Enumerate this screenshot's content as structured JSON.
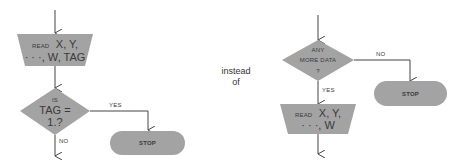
{
  "colors": {
    "shape_fill": "#a3a3a3",
    "line": "#444444",
    "text": "#3a3a3a",
    "background": "#ffffff"
  },
  "left_flowchart": {
    "input": {
      "keyword": "READ",
      "line1": "X, Y,",
      "line2": "· · ·, W, TAG"
    },
    "decision": {
      "line1": "IS",
      "line2": "TAG =",
      "line3": "1.?"
    },
    "yes_label": "YES",
    "no_label": "NO",
    "terminal": {
      "label": "STOP"
    }
  },
  "caption": {
    "line1": "instead",
    "line2": "of"
  },
  "right_flowchart": {
    "decision": {
      "line1": "ANY",
      "line2": "MORE DATA",
      "line3": "?"
    },
    "no_label": "NO",
    "yes_label": "YES",
    "terminal": {
      "label": "STOP"
    },
    "input": {
      "keyword": "READ",
      "line1": "X, Y,",
      "line2": "· · ·, W"
    }
  }
}
